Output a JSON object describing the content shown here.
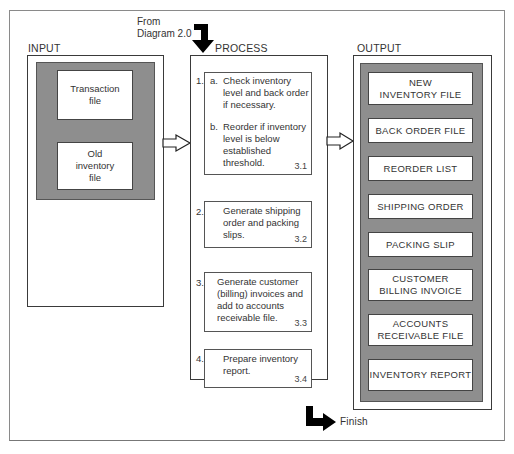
{
  "diagram": {
    "incoming": {
      "label_line1": "From",
      "label_line2": "Diagram 2.0"
    },
    "outgoing": {
      "label": "Finish"
    },
    "input": {
      "title": "INPUT",
      "items": [
        {
          "line1": "Transaction",
          "line2": "file"
        },
        {
          "line1": "Old",
          "line2": "inventory",
          "line3": "file"
        }
      ]
    },
    "process": {
      "title": "PROCESS",
      "steps": [
        {
          "number": "1.",
          "a_marker": "a.",
          "a_line1": "Check inventory",
          "a_line2": "level and back order",
          "a_line3": "if necessary.",
          "b_marker": "b.",
          "b_line1": "Reorder if inventory",
          "b_line2": "level is below",
          "b_line3": "established threshold.",
          "ref": "3.1"
        },
        {
          "number": "2.",
          "line1": "Generate shipping",
          "line2": "order and packing",
          "line3": "slips.",
          "ref": "3.2"
        },
        {
          "number": "3.",
          "line1": "Generate customer",
          "line2": "(billing) invoices and",
          "line3": "add to accounts",
          "line4": "receivable file.",
          "ref": "3.3"
        },
        {
          "number": "4.",
          "line1": "Prepare inventory",
          "line2": "report.",
          "ref": "3.4"
        }
      ]
    },
    "output": {
      "title": "OUTPUT",
      "items": [
        {
          "line1": "NEW",
          "line2": "INVENTORY FILE"
        },
        {
          "line1": "BACK ORDER FILE"
        },
        {
          "line1": "REORDER LIST"
        },
        {
          "line1": "SHIPPING ORDER"
        },
        {
          "line1": "PACKING SLIP"
        },
        {
          "line1": "CUSTOMER",
          "line2": "BILLING INVOICE"
        },
        {
          "line1": "ACCOUNTS",
          "line2": "RECEIVABLE FILE"
        },
        {
          "line1": "INVENTORY REPORT"
        }
      ]
    },
    "colors": {
      "shade": "#8e8e8e",
      "line": "#3a3a3a",
      "arrow": "#000000"
    }
  }
}
